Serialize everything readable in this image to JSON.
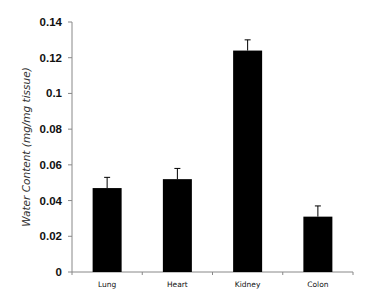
{
  "chart_data": {
    "type": "bar",
    "title": "",
    "xlabel": "",
    "ylabel": "Water Content (mg/mg tissue)",
    "categories": [
      "Lung",
      "Heart",
      "Kidney",
      "Colon"
    ],
    "values": [
      0.047,
      0.052,
      0.124,
      0.031
    ],
    "error_upper": [
      0.006,
      0.006,
      0.006,
      0.006
    ],
    "ylim": [
      0,
      0.14
    ],
    "yticks": [
      "0",
      "0.02",
      "0.04",
      "0.06",
      "0.08",
      "0.1",
      "0.12",
      "0.14"
    ],
    "grid": false,
    "legend": null,
    "bar_color": "#000000"
  }
}
